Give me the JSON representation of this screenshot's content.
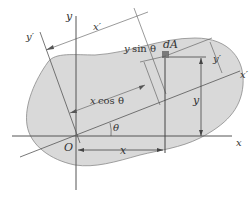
{
  "diagram": {
    "labels": {
      "y_axis": "y",
      "x_axis": "x",
      "y_prime_axis": "y′",
      "x_prime_axis": "x′",
      "x_prime_dim": "x′",
      "y_prime_dim": "y′",
      "origin": "O",
      "theta_angle": "θ",
      "dA": "dA",
      "y_sin_theta_var": "y",
      "y_sin_theta_fn": "sin θ",
      "x_cos_theta_var": "x",
      "x_cos_theta_fn": "cos θ",
      "x_dim": "x",
      "y_dim": "y"
    },
    "colors": {
      "region_fill": "#d9d9d9",
      "region_stroke": "#8a8a8a",
      "line": "#444444",
      "element": "#7a7a7a"
    }
  }
}
